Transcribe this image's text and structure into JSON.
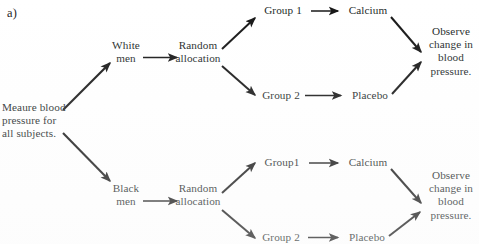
{
  "figure": {
    "panel_label": "a)",
    "type": "flowchart"
  },
  "nodes": {
    "start": "Meaure blood\npressure for\nall subjects.",
    "block_top": "White\nmen",
    "block_bottom": "Black\nmen",
    "randomize_top": "Random\nallocation",
    "randomize_bottom": "Random\nallocation",
    "group1_top": "Group 1",
    "group2_top": "Group 2",
    "group1_bottom": "Group1",
    "group2_bottom": "Group 2",
    "treatment_top_1": "Calcium",
    "treatment_top_2": "Placebo",
    "treatment_bottom_1": "Calcium",
    "treatment_bottom_2": "Placebo",
    "observe_top": "Observe\nchange in\nblood\npressure.",
    "observe_bottom": "Observe\nchange in\nblood\npressure."
  },
  "colors": {
    "background": "#ffffff",
    "ink": "#211f1f",
    "arrow": "#141414"
  }
}
